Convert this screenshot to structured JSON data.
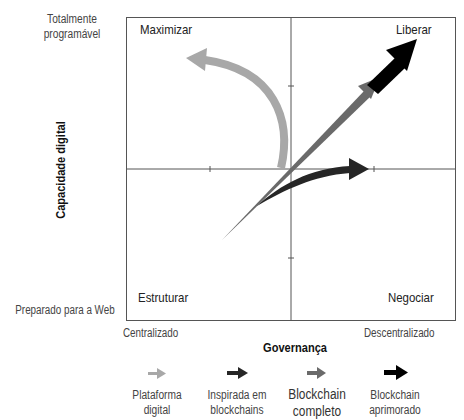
{
  "y_axis": {
    "title": "Capacidade digital",
    "top_label": "Totalmente programável",
    "top_label_lines": [
      "Totalmente",
      "programável"
    ],
    "bottom_label": "Preparado para a Web"
  },
  "x_axis": {
    "title": "Governança",
    "left_label": "Centralizado",
    "right_label": "Descentralizado"
  },
  "quadrants": {
    "top_left": "Maximizar",
    "top_right": "Liberar",
    "bottom_left": "Estruturar",
    "bottom_right": "Negociar"
  },
  "legend": [
    {
      "label_lines": [
        "Plataforma",
        "digital"
      ],
      "color": "#a8a8a8"
    },
    {
      "label_lines": [
        "Inspirada em",
        "blockchains"
      ],
      "color": "#262626"
    },
    {
      "label_lines": [
        "Blockchain",
        "completo"
      ],
      "color": "#6a6a6a"
    },
    {
      "label_lines": [
        "Blockchain",
        "aprimorado"
      ],
      "color": "#000000"
    }
  ],
  "colors": {
    "frame": "#555555",
    "axis": "#555555",
    "plataforma_digital": "#a8a8a8",
    "inspirada_em_blockchains": "#262626",
    "blockchain_completo": "#6a6a6a",
    "blockchain_aprimorado": "#000000"
  }
}
